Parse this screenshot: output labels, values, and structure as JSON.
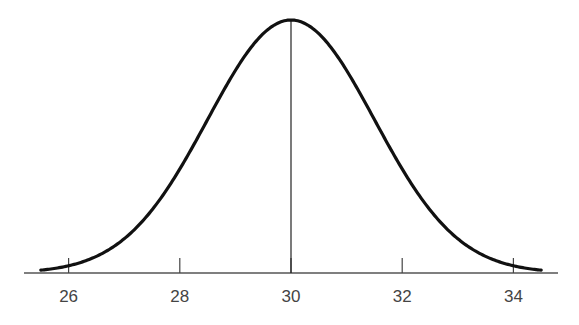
{
  "chart_data": {
    "type": "line",
    "title": "",
    "xlabel": "",
    "ylabel": "",
    "distribution": {
      "mean": 30,
      "sd": 1.5
    },
    "x_range": [
      25.5,
      34.5
    ],
    "xlim": [
      24.8,
      35.0
    ],
    "ticks": [
      26,
      28,
      30,
      32,
      34
    ],
    "tick_labels": [
      "26",
      "28",
      "30",
      "32",
      "34"
    ],
    "mean_line": {
      "x": 30
    },
    "grid": false,
    "legend": null
  },
  "colors": {
    "curve": "#111111",
    "axis": "#555555",
    "text": "#444444"
  }
}
